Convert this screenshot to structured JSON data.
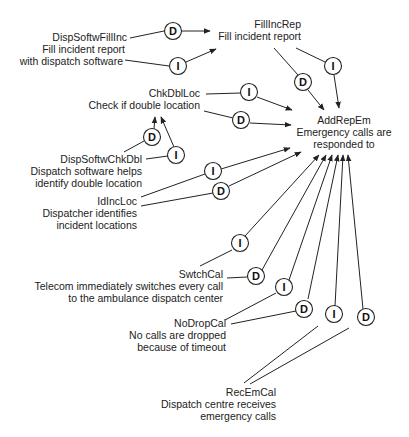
{
  "diagram": {
    "type": "goal-contribution-graph",
    "legend_hint": {
      "D": "direct contribution",
      "I": "indirect contribution"
    },
    "nodes": [
      {
        "id": "DispSoftwFillInc",
        "name": "DispSoftwFillInc",
        "desc": [
          "Fill incident report",
          "with dispatch software"
        ]
      },
      {
        "id": "FillIncRep",
        "name": "FillIncRep",
        "desc": [
          "Fill incident report"
        ]
      },
      {
        "id": "ChkDblLoc",
        "name": "ChkDblLoc",
        "desc": [
          "Check if double location"
        ]
      },
      {
        "id": "AddRepEm",
        "name": "AddRepEm",
        "desc": [
          "Emergency calls are",
          "responded to"
        ]
      },
      {
        "id": "DispSoftwChkDbl",
        "name": "DispSoftwChkDbl",
        "desc": [
          "Dispatch software helps",
          "identify double location"
        ]
      },
      {
        "id": "IdIncLoc",
        "name": "IdIncLoc",
        "desc": [
          "Dispatcher identifies",
          "incident locations"
        ]
      },
      {
        "id": "SwtchCal",
        "name": "SwtchCal",
        "desc": [
          "Telecom immediately switches every call",
          "to the ambulance dispatch center"
        ]
      },
      {
        "id": "NoDropCal",
        "name": "NoDropCal",
        "desc": [
          "No calls are dropped",
          "because of timeout"
        ]
      },
      {
        "id": "RecEmCal",
        "name": "RecEmCal",
        "desc": [
          "Dispatch centre receives",
          "emergency calls"
        ]
      }
    ],
    "edges": [
      {
        "from": "DispSoftwFillInc",
        "to": "FillIncRep",
        "type": "D"
      },
      {
        "from": "DispSoftwFillInc",
        "to": "FillIncRep",
        "type": "I"
      },
      {
        "from": "FillIncRep",
        "to": "AddRepEm",
        "type": "D"
      },
      {
        "from": "FillIncRep",
        "to": "AddRepEm",
        "type": "I"
      },
      {
        "from": "ChkDblLoc",
        "to": "AddRepEm",
        "type": "I"
      },
      {
        "from": "ChkDblLoc",
        "to": "AddRepEm",
        "type": "D"
      },
      {
        "from": "DispSoftwChkDbl",
        "to": "ChkDblLoc",
        "type": "D"
      },
      {
        "from": "DispSoftwChkDbl",
        "to": "ChkDblLoc",
        "type": "I"
      },
      {
        "from": "IdIncLoc",
        "to": "AddRepEm",
        "type": "I"
      },
      {
        "from": "IdIncLoc",
        "to": "AddRepEm",
        "type": "D"
      },
      {
        "from": "SwtchCal",
        "to": "AddRepEm",
        "type": "I"
      },
      {
        "from": "SwtchCal",
        "to": "AddRepEm",
        "type": "D"
      },
      {
        "from": "NoDropCal",
        "to": "AddRepEm",
        "type": "I"
      },
      {
        "from": "NoDropCal",
        "to": "AddRepEm",
        "type": "D"
      },
      {
        "from": "RecEmCal",
        "to": "AddRepEm",
        "type": "I"
      },
      {
        "from": "RecEmCal",
        "to": "AddRepEm",
        "type": "D"
      }
    ]
  },
  "labels": {
    "dispsoftwfillinc_name": "DispSoftwFillInc",
    "dispsoftwfillinc_desc1": "Fill incident report",
    "dispsoftwfillinc_desc2": "with dispatch software",
    "fillincrep_name": "FillIncRep",
    "fillincrep_desc1": "Fill incident report",
    "chkdblloc_name": "ChkDblLoc",
    "chkdblloc_desc1": "Check if double location",
    "addrepem_name": "AddRepEm",
    "addrepem_desc1": "Emergency calls are",
    "addrepem_desc2": "responded to",
    "dispsoftwchkdbl_name": "DispSoftwChkDbl",
    "dispsoftwchkdbl_desc1": "Dispatch software helps",
    "dispsoftwchkdbl_desc2": "identify double location",
    "idincloc_name": "IdIncLoc",
    "idincloc_desc1": "Dispatcher identifies",
    "idincloc_desc2": "incident locations",
    "swtchcal_name": "SwtchCal",
    "swtchcal_desc1": "Telecom immediately switches every call",
    "swtchcal_desc2": "to the ambulance dispatch center",
    "nodropcal_name": "NoDropCal",
    "nodropcal_desc1": "No calls are dropped",
    "nodropcal_desc2": "because of timeout",
    "recemcal_name": "RecEmCal",
    "recemcal_desc1": "Dispatch centre receives",
    "recemcal_desc2": "emergency calls"
  },
  "markers": {
    "d": "D",
    "i": "I"
  }
}
